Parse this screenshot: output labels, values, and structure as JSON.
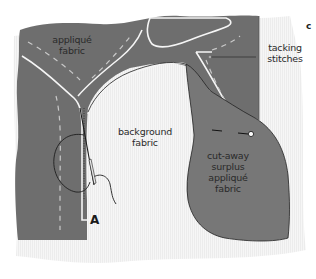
{
  "figure": {
    "panel_label": "c",
    "point_label": "A",
    "labels": {
      "applique_fabric": "appliqué\nfabric",
      "tacking_stitches": "tacking\nstitches",
      "background_fabric": "background\nfabric",
      "cutaway": "cut-away\nsurplus\nappliqué\nfabric"
    },
    "colors": {
      "applique_fill": "#6e6e6e",
      "cutaway_fill": "#777777",
      "background_fill": "#f4f4f4",
      "outline_white": "#f5f5f5",
      "thread": "#1e1e1e",
      "leader_line": "#333333"
    },
    "icons": {
      "needle": "needle-icon",
      "pin": "pin-icon",
      "thread_loop": "thread-loop-icon"
    }
  }
}
